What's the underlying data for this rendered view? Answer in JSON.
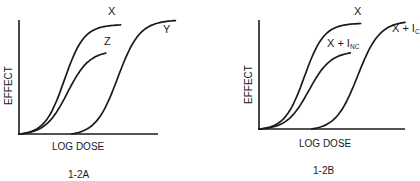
{
  "chart_data": [
    {
      "type": "line",
      "panel": "1-2A",
      "caption": "1-2A",
      "xlabel": "LOG DOSE",
      "ylabel": "EFFECT",
      "grid": false,
      "xlim": [
        0,
        10
      ],
      "ylim": [
        0,
        10
      ],
      "series": [
        {
          "name": "X",
          "label": "X",
          "sub": "",
          "start_x": 0,
          "x50": 3.0,
          "max_effect": 9.6,
          "end_x": 6.8,
          "steepness": 0.95
        },
        {
          "name": "Z",
          "label": "Z",
          "sub": "",
          "start_x": 0,
          "x50": 3.2,
          "max_effect": 7.3,
          "end_x": 5.8,
          "steepness": 0.85
        },
        {
          "name": "Y",
          "label": "Y",
          "sub": "",
          "start_x": 3.5,
          "x50": 6.6,
          "max_effect": 10.0,
          "end_x": 10.5,
          "steepness": 0.85
        }
      ]
    },
    {
      "type": "line",
      "panel": "1-2B",
      "caption": "1-2B",
      "xlabel": "LOG DOSE",
      "ylabel": "EFFECT",
      "grid": false,
      "xlim": [
        0,
        10
      ],
      "ylim": [
        0,
        10
      ],
      "series": [
        {
          "name": "X",
          "label": "X",
          "sub": "",
          "start_x": 0,
          "x50": 3.0,
          "max_effect": 9.8,
          "end_x": 6.8,
          "steepness": 0.95
        },
        {
          "name": "X + I_NC",
          "label": "X + I",
          "sub": "NC",
          "start_x": 0,
          "x50": 3.3,
          "max_effect": 7.2,
          "end_x": 6.1,
          "steepness": 0.85
        },
        {
          "name": "X + I_C",
          "label": "X + I",
          "sub": "C",
          "start_x": 3.5,
          "x50": 6.6,
          "max_effect": 10.0,
          "end_x": 9.8,
          "steepness": 0.85
        }
      ]
    }
  ]
}
